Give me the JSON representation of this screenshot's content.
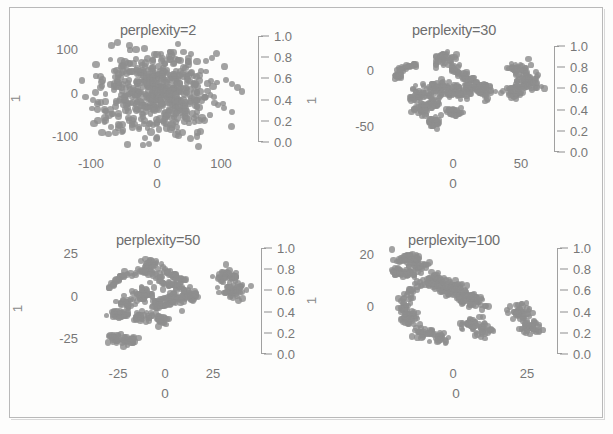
{
  "figure": {
    "title": "",
    "background_color": "#fdfdfc",
    "frame_color": "#b9b9b9",
    "point_color": "#8e8e8e",
    "text_color": "#777777"
  },
  "chart_data": [
    {
      "type": "scatter",
      "title": "perplexity=2",
      "xlabel": "0",
      "ylabel": "1",
      "xticks": [
        "-100",
        "0",
        "100"
      ],
      "xtick_values": [
        -100,
        0,
        100
      ],
      "yticks": [
        "100",
        "0",
        "-100"
      ],
      "ytick_values": [
        100,
        0,
        -100
      ],
      "xlim": [
        -165,
        165
      ],
      "ylim": [
        -165,
        165
      ],
      "grid": false,
      "n_points": 520,
      "description": "Single large diffuse isotropic blob centered at origin, no cluster separation",
      "colorbar": {
        "label": "",
        "ticks": [
          "1.0",
          "0.8",
          "0.6",
          "0.4",
          "0.2",
          "0.0"
        ],
        "tick_values": [
          1.0,
          0.8,
          0.6,
          0.4,
          0.2,
          0.0
        ],
        "vmin": 0.0,
        "vmax": 1.0
      }
    },
    {
      "type": "scatter",
      "title": "perplexity=30",
      "xlabel": "0",
      "ylabel": "1",
      "xticks": [
        "0",
        "50"
      ],
      "xtick_values": [
        0,
        50
      ],
      "yticks": [
        "0",
        "-50"
      ],
      "ytick_values": [
        0,
        -50
      ],
      "xlim": [
        -55,
        85
      ],
      "ylim": [
        -80,
        55
      ],
      "grid": false,
      "n_points": 520,
      "description": "Several distinct small clusters plus one separated compact cluster on the right",
      "colorbar": {
        "label": "",
        "ticks": [
          "1.0",
          "0.8",
          "0.6",
          "0.4",
          "0.2",
          "0.0"
        ],
        "tick_values": [
          1.0,
          0.8,
          0.6,
          0.4,
          0.2,
          0.0
        ],
        "vmin": 0.0,
        "vmax": 1.0
      }
    },
    {
      "type": "scatter",
      "title": "perplexity=50",
      "xlabel": "0",
      "ylabel": "1",
      "xticks": [
        "-25",
        "0",
        "25"
      ],
      "xtick_values": [
        -25,
        0,
        25
      ],
      "yticks": [
        "25",
        "0",
        "-25"
      ],
      "ytick_values": [
        25,
        0,
        -25
      ],
      "xlim": [
        -45,
        45
      ],
      "ylim": [
        -45,
        40
      ],
      "grid": false,
      "n_points": 520,
      "description": "Arc-shaped main group with sub-clusters and one isolated blob on the right",
      "colorbar": {
        "label": "",
        "ticks": [
          "1.0",
          "0.8",
          "0.6",
          "0.4",
          "0.2",
          "0.0"
        ],
        "tick_values": [
          1.0,
          0.8,
          0.6,
          0.4,
          0.2,
          0.0
        ],
        "vmin": 0.0,
        "vmax": 1.0
      }
    },
    {
      "type": "scatter",
      "title": "perplexity=100",
      "xlabel": "0",
      "ylabel": "1",
      "xticks": [
        "0",
        "25"
      ],
      "xtick_values": [
        0,
        25
      ],
      "yticks": [
        "20",
        "0"
      ],
      "ytick_values": [
        20,
        0
      ],
      "xlim": [
        -32,
        42
      ],
      "ylim": [
        -30,
        32
      ],
      "grid": false,
      "n_points": 520,
      "description": "Diagonal elongated band of merged clusters with a separate blob at lower right",
      "colorbar": {
        "label": "",
        "ticks": [
          "1.0",
          "0.8",
          "0.6",
          "0.4",
          "0.2",
          "0.0"
        ],
        "tick_values": [
          1.0,
          0.8,
          0.6,
          0.4,
          0.2,
          0.0
        ],
        "vmin": 0.0,
        "vmax": 1.0
      }
    }
  ]
}
